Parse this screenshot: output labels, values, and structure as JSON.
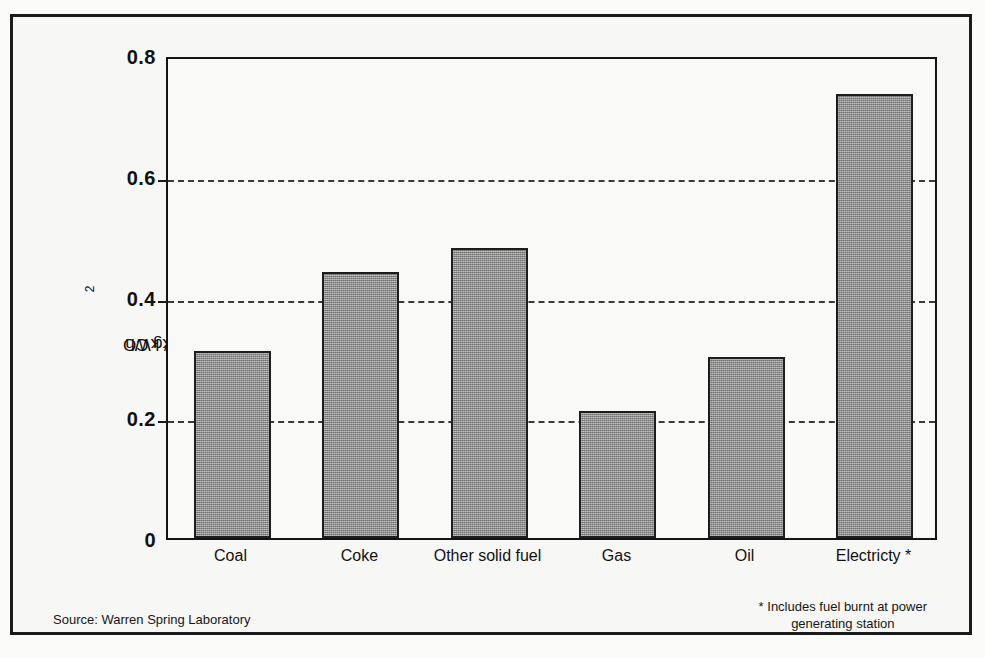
{
  "chart_data": {
    "type": "bar",
    "title": "",
    "xlabel": "",
    "ylabel": "kg CO2/ kWh",
    "ylabel_parts": {
      "prefix": "kg CO",
      "sub": "2",
      "suffix": "/ kWh"
    },
    "categories": [
      "Coal",
      "Coke",
      "Other solid fuel",
      "Gas",
      "Oil",
      "Electricty *"
    ],
    "values": [
      0.31,
      0.44,
      0.48,
      0.21,
      0.3,
      0.735
    ],
    "ylim": [
      0,
      0.8
    ],
    "yticks": [
      0,
      0.2,
      0.4,
      0.6,
      0.8
    ],
    "ytick_labels": [
      "0",
      "0.2",
      "0.4",
      "0.6",
      "0.8"
    ],
    "grid": "horizontal-dashed",
    "gridlines_at": [
      0.2,
      0.4,
      0.6
    ],
    "legend": "none",
    "bar_color": "#8d8d8d",
    "bar_edge_color": "#1d1d1d",
    "axis_color": "#141414",
    "background_color": "#f7f7f5"
  },
  "notes": {
    "source": "Source: Warren Spring Laboratory",
    "footnote_line1": "* Includes fuel burnt at power",
    "footnote_line2": "generating station"
  }
}
